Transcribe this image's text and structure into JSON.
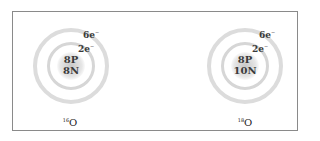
{
  "diagram": {
    "title": "",
    "atoms": [
      {
        "isotope_mass": "16",
        "element": "O",
        "protons": "8P",
        "neutrons": "8N",
        "shells": [
          {
            "label": "2e",
            "charge": "−"
          },
          {
            "label": "6e",
            "charge": "−"
          }
        ]
      },
      {
        "isotope_mass": "18",
        "element": "O",
        "protons": "8P",
        "neutrons": "10N",
        "shells": [
          {
            "label": "2e",
            "charge": "−"
          },
          {
            "label": "6e",
            "charge": "−"
          }
        ]
      }
    ],
    "colors": {
      "frame": "#8a8a8a",
      "rings": "#dcdcdc",
      "text": "#3a3a3a"
    }
  }
}
